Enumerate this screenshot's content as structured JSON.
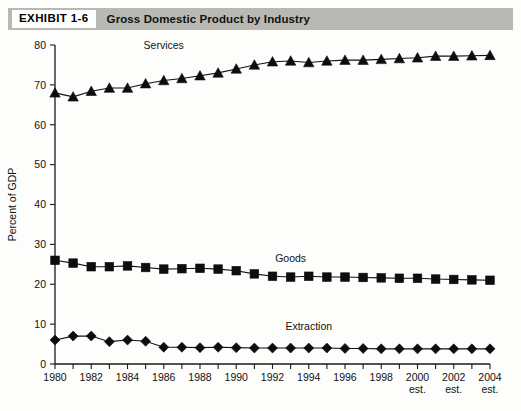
{
  "header": {
    "tag": "EXHIBIT 1-6",
    "title": "Gross Domestic Product by Industry"
  },
  "chart_data": {
    "type": "line",
    "title": "Gross Domestic Product by Industry",
    "xlabel": "",
    "ylabel": "Percent of GDP",
    "ylim": [
      0,
      80
    ],
    "ytick_step": 10,
    "yticks": [
      0,
      10,
      20,
      30,
      40,
      50,
      60,
      70,
      80
    ],
    "grid": false,
    "legend_position": "inline-annotations",
    "x": [
      1980,
      1981,
      1982,
      1983,
      1984,
      1985,
      1986,
      1987,
      1988,
      1989,
      1990,
      1991,
      1992,
      1993,
      1994,
      1995,
      1996,
      1997,
      1998,
      1999,
      2000,
      2001,
      2002,
      2003,
      2004
    ],
    "xtick_labels": [
      {
        "year": 1980,
        "label": "1980",
        "sub": ""
      },
      {
        "year": 1981,
        "label": "",
        "sub": ""
      },
      {
        "year": 1982,
        "label": "1982",
        "sub": ""
      },
      {
        "year": 1983,
        "label": "",
        "sub": ""
      },
      {
        "year": 1984,
        "label": "1984",
        "sub": ""
      },
      {
        "year": 1985,
        "label": "",
        "sub": ""
      },
      {
        "year": 1986,
        "label": "1986",
        "sub": ""
      },
      {
        "year": 1987,
        "label": "",
        "sub": ""
      },
      {
        "year": 1988,
        "label": "1988",
        "sub": ""
      },
      {
        "year": 1989,
        "label": "",
        "sub": ""
      },
      {
        "year": 1990,
        "label": "1990",
        "sub": ""
      },
      {
        "year": 1991,
        "label": "",
        "sub": ""
      },
      {
        "year": 1992,
        "label": "1992",
        "sub": ""
      },
      {
        "year": 1993,
        "label": "",
        "sub": ""
      },
      {
        "year": 1994,
        "label": "1994",
        "sub": ""
      },
      {
        "year": 1995,
        "label": "",
        "sub": ""
      },
      {
        "year": 1996,
        "label": "1996",
        "sub": ""
      },
      {
        "year": 1997,
        "label": "",
        "sub": ""
      },
      {
        "year": 1998,
        "label": "1998",
        "sub": ""
      },
      {
        "year": 1999,
        "label": "",
        "sub": ""
      },
      {
        "year": 2000,
        "label": "2000",
        "sub": "est."
      },
      {
        "year": 2001,
        "label": "",
        "sub": ""
      },
      {
        "year": 2002,
        "label": "2002",
        "sub": "est."
      },
      {
        "year": 2003,
        "label": "",
        "sub": ""
      },
      {
        "year": 2004,
        "label": "2004",
        "sub": "est."
      }
    ],
    "series": [
      {
        "name": "Services",
        "marker": "triangle",
        "color": "#0d0d0d",
        "label_x": 1986,
        "label_y": 79,
        "values": [
          68.0,
          67.0,
          68.4,
          69.2,
          69.2,
          70.3,
          71.1,
          71.6,
          72.3,
          73.0,
          74.0,
          75.0,
          75.8,
          76.0,
          75.6,
          76.0,
          76.2,
          76.2,
          76.4,
          76.6,
          76.8,
          77.2,
          77.2,
          77.3,
          77.4
        ]
      },
      {
        "name": "Goods",
        "marker": "square",
        "color": "#0d0d0d",
        "label_x": 1993,
        "label_y": 25.5,
        "values": [
          26.0,
          25.3,
          24.4,
          24.4,
          24.6,
          24.2,
          23.8,
          23.9,
          24.0,
          23.8,
          23.4,
          22.6,
          22.0,
          21.8,
          22.0,
          21.8,
          21.8,
          21.7,
          21.6,
          21.5,
          21.5,
          21.3,
          21.2,
          21.1,
          21.0
        ]
      },
      {
        "name": "Extraction",
        "marker": "diamond",
        "color": "#0d0d0d",
        "label_x": 1994,
        "label_y": 8.6,
        "values": [
          6.0,
          7.0,
          7.0,
          5.6,
          6.0,
          5.7,
          4.2,
          4.2,
          4.1,
          4.2,
          4.1,
          4.0,
          4.0,
          4.0,
          4.0,
          4.0,
          3.9,
          3.9,
          3.8,
          3.8,
          3.8,
          3.8,
          3.8,
          3.8,
          3.8
        ]
      }
    ]
  }
}
